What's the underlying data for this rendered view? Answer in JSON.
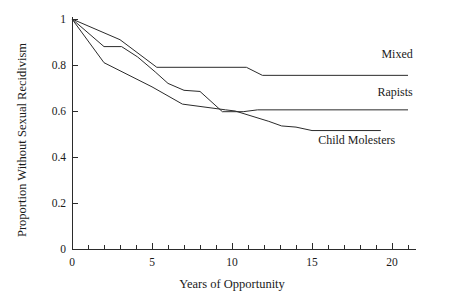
{
  "chart_data": {
    "type": "line",
    "title": "",
    "xlabel": "Years of Opportunity",
    "ylabel": "Proportion Without Sexual Recidivism",
    "xlim": [
      0,
      21.5
    ],
    "ylim": [
      0,
      1
    ],
    "xticks": [
      0,
      1,
      2,
      3,
      4,
      5,
      6,
      7,
      8,
      9,
      10,
      11,
      12,
      13,
      14,
      15,
      16,
      17,
      18,
      19,
      20,
      21
    ],
    "xtick_labels": [
      "0",
      "",
      "",
      "",
      "",
      "5",
      "",
      "",
      "",
      "",
      "10",
      "",
      "",
      "",
      "",
      "15",
      "",
      "",
      "",
      "",
      "20",
      ""
    ],
    "xtick_major": [
      0,
      5,
      10,
      15,
      20
    ],
    "xtick_major_labels": [
      "0",
      "5",
      "10",
      "15",
      "20"
    ],
    "yticks": [
      0,
      0.2,
      0.4,
      0.6,
      0.8,
      1
    ],
    "ytick_labels": [
      "0",
      "0.2",
      "0.4",
      "0.6",
      "0.8",
      "1"
    ],
    "grid": false,
    "legend_position": "right-inline",
    "line_color": "#2b2b2b",
    "series": [
      {
        "name": "Mixed",
        "label": "Mixed",
        "label_x": 21.3,
        "label_y": 0.83,
        "points": [
          [
            0,
            1.0
          ],
          [
            3,
            0.91
          ],
          [
            5.3,
            0.79
          ],
          [
            10.9,
            0.79
          ],
          [
            11.9,
            0.755
          ],
          [
            21.0,
            0.755
          ]
        ]
      },
      {
        "name": "Rapists",
        "label": "Rapists",
        "label_x": 21.3,
        "label_y": 0.665,
        "points": [
          [
            0,
            1.0
          ],
          [
            2.0,
            0.88
          ],
          [
            3.1,
            0.88
          ],
          [
            4.1,
            0.835
          ],
          [
            5.2,
            0.77
          ],
          [
            6.0,
            0.72
          ],
          [
            7.0,
            0.69
          ],
          [
            8.0,
            0.685
          ],
          [
            9.4,
            0.597
          ],
          [
            10.7,
            0.597
          ],
          [
            11.6,
            0.605
          ],
          [
            21.0,
            0.605
          ]
        ]
      },
      {
        "name": "Child Molesters",
        "label": "Child Molesters",
        "label_x": 20.2,
        "label_y": 0.455,
        "points": [
          [
            0,
            1.0
          ],
          [
            2.0,
            0.81
          ],
          [
            5.0,
            0.705
          ],
          [
            6.9,
            0.63
          ],
          [
            9.6,
            0.605
          ],
          [
            10.2,
            0.6
          ],
          [
            12.3,
            0.555
          ],
          [
            13.1,
            0.535
          ],
          [
            14.0,
            0.53
          ],
          [
            15.0,
            0.515
          ],
          [
            19.3,
            0.515
          ]
        ]
      }
    ]
  }
}
